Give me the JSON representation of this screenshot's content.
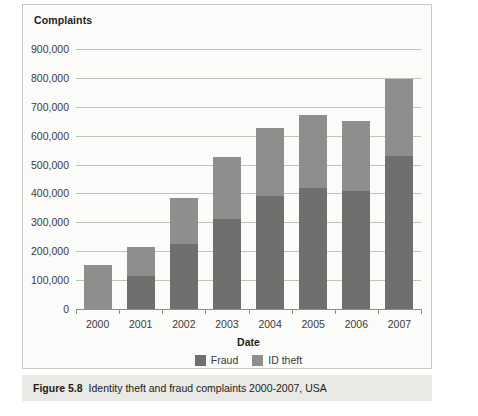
{
  "figure": {
    "caption_number": "Figure 5.8",
    "caption_text": "Identity theft and fraud complaints 2000-2007, USA"
  },
  "chart_data": {
    "type": "bar",
    "stacked": true,
    "title": "Complaints",
    "xlabel": "Date",
    "ylabel": "Complaints",
    "categories": [
      "2000",
      "2001",
      "2002",
      "2003",
      "2004",
      "2005",
      "2006",
      "2007"
    ],
    "series": [
      {
        "name": "Fraud",
        "color": "#6f6f6e",
        "values": [
          0,
          115000,
          225000,
          310000,
          390000,
          420000,
          410000,
          530000
        ]
      },
      {
        "name": "ID theft",
        "color": "#8e8e8c",
        "values": [
          152000,
          100000,
          160000,
          215000,
          235000,
          250000,
          240000,
          265000
        ]
      }
    ],
    "totals": [
      152000,
      215000,
      385000,
      525000,
      625000,
      670000,
      650000,
      795000
    ],
    "ylim": [
      0,
      900000
    ],
    "ytick_step": 100000,
    "ytick_labels": [
      "900,000",
      "800,000",
      "700,000",
      "600,000",
      "500,000",
      "400,000",
      "300,000",
      "200,000",
      "100,000",
      "0"
    ],
    "ytick_values": [
      900000,
      800000,
      700000,
      600000,
      500000,
      400000,
      300000,
      200000,
      100000,
      0
    ],
    "grid": true,
    "legend_position": "bottom",
    "legend": [
      "Fraud",
      "ID theft"
    ]
  }
}
